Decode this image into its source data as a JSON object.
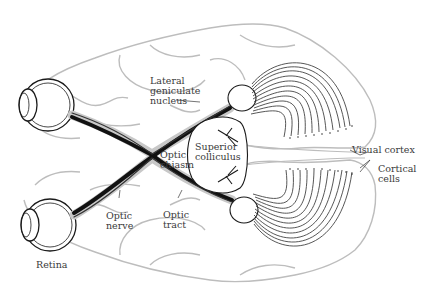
{
  "diagram": {
    "colors": {
      "brain_outline": "#bdbdbd",
      "ink": "#1a1a1a",
      "fiber": "#444444",
      "label": "#3a3a3a",
      "background": "#ffffff"
    },
    "labels": {
      "lateral_geniculate": "Lateral\ngeniculate\nnucleus",
      "optic_chiasm": "Optic\nchiasm",
      "superior_colliculus": "Superior\ncolliculus",
      "visual_cortex": "Visual cortex",
      "cortical_cells": "Cortical\ncells",
      "optic_nerve": "Optic\nnerve",
      "optic_tract": "Optic\ntract",
      "retina": "Retina"
    },
    "structures": [
      "left-eye",
      "right-eye",
      "optic-nerve-upper",
      "optic-nerve-lower",
      "optic-chiasm",
      "optic-tract-upper",
      "optic-tract-lower",
      "lateral-geniculate-nucleus-upper",
      "lateral-geniculate-nucleus-lower",
      "superior-colliculus",
      "optic-radiations-upper",
      "optic-radiations-lower",
      "visual-cortex",
      "brain-hemisphere-upper",
      "brain-hemisphere-lower"
    ]
  }
}
